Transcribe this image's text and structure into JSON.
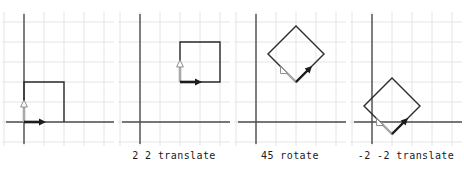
{
  "figure": {
    "background_color": "#ffffff",
    "width": 464,
    "height": 179,
    "grid_color": "#e2e2e6",
    "axis_color": "#4d4d4d",
    "shape_color": "#1a1a1a",
    "x_arrow_color": "#1a1a1a",
    "y_arrow_color": "#a8a8a8",
    "caption_color": "#1a1a1a",
    "grid_spacing_px": 20
  },
  "panels": [
    {
      "id": "panel-original",
      "caption": "",
      "shape": "unit-square",
      "origin_grid": [
        1,
        5
      ],
      "square_corners_grid": [
        [
          1,
          5
        ],
        [
          3,
          5
        ],
        [
          3,
          3
        ],
        [
          1,
          3
        ]
      ],
      "x_axis_arrow": {
        "from_grid": [
          1,
          5
        ],
        "to_grid": [
          2,
          5
        ],
        "color": "#1a1a1a"
      },
      "y_axis_arrow": {
        "from_grid": [
          1,
          5
        ],
        "to_grid": [
          1,
          4
        ],
        "color": "#a8a8a8"
      }
    },
    {
      "id": "panel-translate-2-2",
      "caption": "2 2 translate",
      "shape": "unit-square",
      "origin_grid": [
        3,
        3
      ],
      "square_corners_grid": [
        [
          3,
          3
        ],
        [
          5,
          3
        ],
        [
          5,
          1
        ],
        [
          3,
          1
        ]
      ],
      "x_axis_arrow": {
        "from_grid": [
          3,
          3
        ],
        "to_grid": [
          4,
          3
        ],
        "color": "#1a1a1a"
      },
      "y_axis_arrow": {
        "from_grid": [
          3,
          3
        ],
        "to_grid": [
          3,
          2
        ],
        "color": "#a8a8a8"
      }
    },
    {
      "id": "panel-rotate-45",
      "caption": "45 rotate",
      "shape": "rotated-square",
      "origin_grid": [
        3,
        3
      ],
      "rotation_degrees": 45,
      "x_axis_arrow": {
        "color": "#1a1a1a",
        "direction_degrees": 45
      },
      "y_axis_arrow": {
        "color": "#a8a8a8",
        "direction_degrees": 135
      }
    },
    {
      "id": "panel-translate-minus2-minus2",
      "caption": "-2 -2 translate",
      "shape": "rotated-square",
      "origin_grid": [
        2,
        5
      ],
      "rotation_degrees": 45,
      "x_axis_arrow": {
        "color": "#1a1a1a",
        "direction_degrees": 45
      },
      "y_axis_arrow": {
        "color": "#a8a8a8",
        "direction_degrees": 135
      }
    }
  ]
}
